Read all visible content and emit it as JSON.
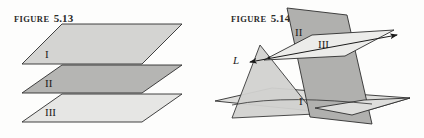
{
  "figures": [
    {
      "id": "figure-5-13",
      "caption_word": "FIGURE",
      "caption_number": "5.13",
      "labels": {
        "plane_1": "I",
        "plane_2": "II",
        "plane_3": "III"
      },
      "colors": {
        "plane_1_fill": "#d4d4d2",
        "plane_2_fill": "#b5b5b3",
        "plane_3_fill": "#e6e6e4",
        "stroke": "#2e2e2e"
      },
      "description": "Three parallel horizontal planes stacked vertically"
    },
    {
      "id": "figure-5-14",
      "caption_word": "FIGURE",
      "caption_number": "5.14",
      "labels": {
        "plane_1": "I",
        "plane_2": "II",
        "plane_3": "III",
        "line": "L"
      },
      "colors": {
        "plane_1_fill": "#d9d9d7",
        "plane_2_fill": "#b0b0ae",
        "plane_3_fill": "#ececea",
        "plane_slant_fill": "#d2d2d0",
        "stroke": "#2e2e2e",
        "line_color": "#1a1a1a"
      },
      "description": "Three intersecting planes meeting along common line L"
    }
  ],
  "page": {
    "background": "#fdfdfc"
  }
}
